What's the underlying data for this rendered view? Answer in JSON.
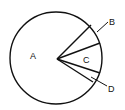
{
  "diagram": {
    "type": "pie-sectors",
    "labels": {
      "A": "A",
      "B": "B",
      "C": "C",
      "D": "D"
    },
    "colors": {
      "stroke": "#111111",
      "background": "#ffffff"
    }
  }
}
